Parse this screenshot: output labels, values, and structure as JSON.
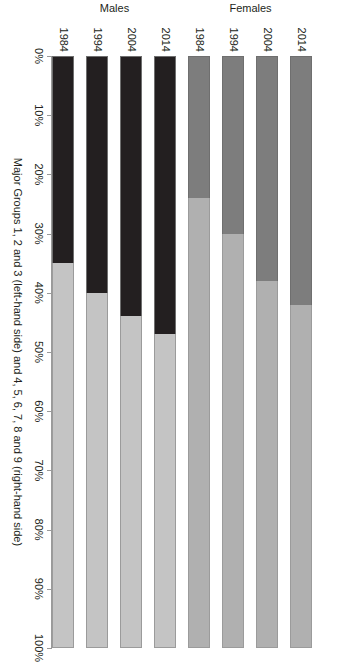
{
  "chart_data": {
    "type": "bar",
    "orientation": "horizontal",
    "stacked": true,
    "stack_mode": "percent",
    "title": "",
    "subtitle": "",
    "xlabel": "Major Groups 1, 2 and 3 (left-hand side)  and 4, 5, 6, 7, 8 and 9 (right-hand side)",
    "ylabel": "",
    "xlim": [
      0,
      100
    ],
    "grid": false,
    "legend": "none",
    "x_tick_labels": [
      "0%",
      "10%",
      "20%",
      "30%",
      "40%",
      "50%",
      "60%",
      "70%",
      "80%",
      "90%",
      "100%"
    ],
    "x_tick_values": [
      0,
      10,
      20,
      30,
      40,
      50,
      60,
      70,
      80,
      90,
      100
    ],
    "group_labels": [
      "Males",
      "Females"
    ],
    "categories": [
      "1984",
      "1994",
      "2004",
      "2014",
      "1984",
      "1994",
      "2004",
      "2014"
    ],
    "series": [
      {
        "name": "Major Groups 1, 2 and 3 (left-hand side)",
        "values": [
          35,
          40,
          44,
          47,
          24,
          30,
          38,
          42
        ]
      },
      {
        "name": "Major Groups 4, 5, 6, 7, 8 and 9 (right-hand side)",
        "values": [
          65,
          60,
          56,
          53,
          76,
          70,
          62,
          58
        ]
      }
    ],
    "bars": [
      {
        "group": "Males",
        "category": "1984",
        "left_value": 35,
        "right_value": 65,
        "left_color": "#231f20",
        "right_color": "#c4c4c4"
      },
      {
        "group": "Males",
        "category": "1994",
        "left_value": 40,
        "right_value": 60,
        "left_color": "#231f20",
        "right_color": "#c4c4c4"
      },
      {
        "group": "Males",
        "category": "2004",
        "left_value": 44,
        "right_value": 56,
        "left_color": "#231f20",
        "right_color": "#c4c4c4"
      },
      {
        "group": "Males",
        "category": "2014",
        "left_value": 47,
        "right_value": 53,
        "left_color": "#231f20",
        "right_color": "#c4c4c4"
      },
      {
        "group": "Females",
        "category": "1984",
        "left_value": 24,
        "right_value": 76,
        "left_color": "#7d7d7d",
        "right_color": "#b0b0b0"
      },
      {
        "group": "Females",
        "category": "1994",
        "left_value": 30,
        "right_value": 70,
        "left_color": "#7d7d7d",
        "right_color": "#b0b0b0"
      },
      {
        "group": "Females",
        "category": "2004",
        "left_value": 38,
        "right_value": 62,
        "left_color": "#7d7d7d",
        "right_color": "#b0b0b0"
      },
      {
        "group": "Females",
        "category": "2014",
        "left_value": 42,
        "right_value": 58,
        "left_color": "#7d7d7d",
        "right_color": "#b0b0b0"
      }
    ],
    "colors": {
      "males_left": "#231f20",
      "males_right": "#c4c4c4",
      "females_left": "#7d7d7d",
      "females_right": "#b0b0b0",
      "axis": "#9a9a9a",
      "text": "#231f20",
      "background": "#ffffff"
    }
  }
}
